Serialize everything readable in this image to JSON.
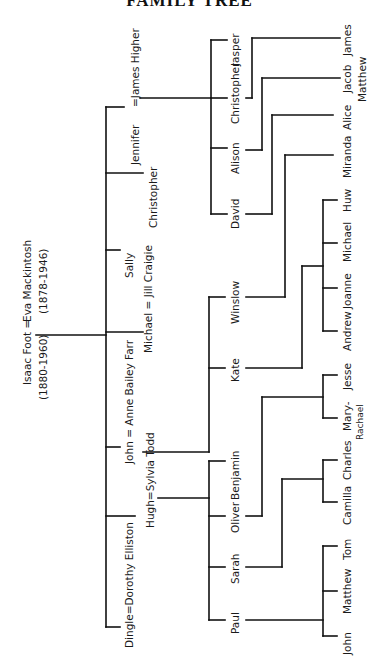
{
  "title": "FAMILY TREE",
  "root": {
    "couple": "Isaac Foot = Eva Mackintosh",
    "isaac_name": "Isaac Foot =",
    "eva_name": "Eva Mackintosh",
    "isaac_dates": "(1880-1960)",
    "eva_dates": "(1878-1946)"
  },
  "generation2": [
    {
      "label": "Jennifer = James Higher"
    },
    {
      "label": "Christopher"
    },
    {
      "label": "Sally"
    },
    {
      "label": "Michael = Jill Craigie"
    },
    {
      "label": "John = Anne Bailey Farr"
    },
    {
      "label": "Hugh = Sylvia Todd"
    },
    {
      "label": "Dingle = Dorothy Elliston"
    }
  ],
  "generation3": {
    "jennifer_children": [
      "Christopher",
      "Alison",
      "David"
    ],
    "john_children": [
      "Winslow",
      "Kate"
    ],
    "hugh_children": [
      "Benjamin",
      "Oliver",
      "Sarah",
      "Paul"
    ]
  },
  "generation4": {
    "christopher_children": [
      "Jasper",
      "James"
    ],
    "alison_children": [
      "Jacob Matthew"
    ],
    "alison_children_line1": "Jacob",
    "alison_children_line2": "Matthew",
    "david_children": [
      "Alice"
    ],
    "winslow_children": [
      "Miranda"
    ],
    "kate_children": [
      "Huw",
      "Michael",
      "Joanne",
      "Andrew"
    ],
    "oliver_children": [
      "Jesse",
      "Mary-Rachael"
    ],
    "mary_line1": "Mary-",
    "mary_line2": "Rachael",
    "sarah_children": [
      "Charles",
      "Camilla"
    ],
    "paul_children": [
      "Tom",
      "Matthew",
      "John"
    ]
  },
  "labels": {
    "jennifer": "Jennifer",
    "james_higher": "=James Higher",
    "christopher_g2": "Christopher",
    "sally": "Sally",
    "michael_jill": "Michael = Jill Craigie",
    "john_anne": "John = Anne Bailey Farr",
    "hugh_sylvia": "Hugh=Sylvia Todd",
    "dingle_dorothy": "Dingle=Dorothy Elliston",
    "christopher_g3": "Christopher",
    "alison": "Alison",
    "david": "David",
    "winslow": "Winslow",
    "kate": "Kate",
    "benjamin": "Benjamin",
    "oliver": "Oliver",
    "sarah": "Sarah",
    "paul": "Paul",
    "jasper": "Jasper",
    "james": "James",
    "alice": "Alice",
    "miranda": "Miranda",
    "huw": "Huw",
    "michael_g4": "Michael",
    "joanne": "Joanne",
    "andrew": "Andrew",
    "jesse": "Jesse",
    "charles": "Charles",
    "camilla": "Camilla",
    "tom": "Tom",
    "matthew": "Matthew",
    "john_g4": "John"
  }
}
